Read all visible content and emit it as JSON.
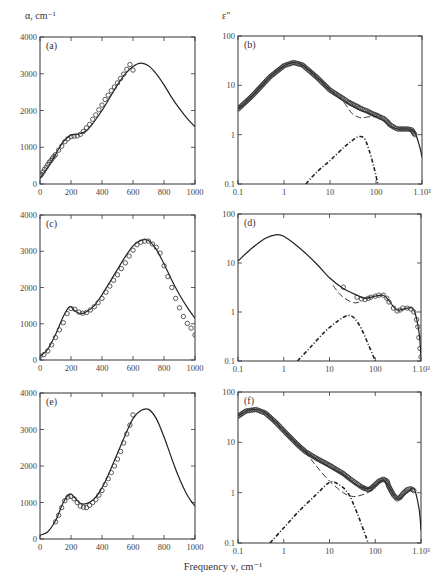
{
  "figure": {
    "left_ylabel": "α, cm⁻¹",
    "right_ylabel": "ε\"",
    "xlabel": "Frequency ν, cm⁻¹",
    "colors": {
      "line": "#222222",
      "frame": "#333333",
      "marker": "#333333",
      "background": "#ffffff"
    }
  },
  "chart_data": [
    {
      "panel": "(a)",
      "type": "line",
      "xscale": "linear",
      "yscale": "linear",
      "frame": [
        40,
        37,
        195,
        184
      ],
      "xlim": [
        0,
        1000
      ],
      "ylim": [
        0,
        4000
      ],
      "xticks": [
        0,
        200,
        400,
        600,
        800,
        1000
      ],
      "xticklabels": [
        "0",
        "200",
        "400",
        "600",
        "800",
        "1000"
      ],
      "yticks": [
        0,
        1000,
        2000,
        3000,
        4000
      ],
      "yticklabels": [
        "0",
        "1000",
        "2000",
        "3000",
        "4000"
      ],
      "ylabel": "α, cm⁻¹",
      "series": [
        {
          "name": "model",
          "style": "solid",
          "x": [
            0,
            50,
            100,
            150,
            200,
            250,
            300,
            350,
            400,
            450,
            500,
            550,
            600,
            650,
            700,
            750,
            800,
            850,
            900,
            950,
            1000
          ],
          "y": [
            150,
            450,
            800,
            1150,
            1330,
            1360,
            1450,
            1700,
            2000,
            2350,
            2700,
            3000,
            3200,
            3290,
            3220,
            3000,
            2700,
            2350,
            2050,
            1780,
            1560
          ]
        },
        {
          "name": "experiment",
          "style": "circles",
          "x": [
            0,
            10,
            20,
            30,
            40,
            50,
            60,
            70,
            80,
            90,
            100,
            120,
            140,
            160,
            180,
            200,
            220,
            240,
            260,
            280,
            300,
            320,
            340,
            360,
            380,
            400,
            420,
            440,
            460,
            480,
            500,
            520,
            540,
            560,
            580,
            600
          ],
          "y": [
            220,
            260,
            330,
            400,
            460,
            530,
            590,
            640,
            700,
            750,
            800,
            920,
            1030,
            1150,
            1230,
            1290,
            1300,
            1310,
            1350,
            1430,
            1530,
            1620,
            1760,
            1880,
            2020,
            2150,
            2300,
            2420,
            2540,
            2640,
            2750,
            2870,
            2990,
            3120,
            3250,
            3100
          ]
        }
      ]
    },
    {
      "panel": "(b)",
      "type": "line",
      "xscale": "log",
      "yscale": "log",
      "frame": [
        238,
        36,
        422,
        184
      ],
      "xlim": [
        0.1,
        1000
      ],
      "ylim": [
        0.1,
        100
      ],
      "xticks": [
        0.1,
        1,
        10,
        100,
        1000
      ],
      "xticklabels": [
        "0.1",
        "1",
        "10",
        "100",
        "1.10³"
      ],
      "yticks": [
        0.1,
        1,
        10,
        100
      ],
      "yticklabels": [
        "0.1",
        "1",
        "10",
        "100"
      ],
      "ylabel": "ε\"",
      "series": [
        {
          "name": "total",
          "style": "solid",
          "x": [
            0.1,
            0.2,
            0.5,
            1,
            1.6,
            2.5,
            5,
            10,
            20,
            40,
            70,
            100,
            150,
            200,
            300,
            500,
            700,
            900,
            1000
          ],
          "y": [
            3.3,
            6,
            15,
            25,
            29,
            26,
            15,
            8,
            4.8,
            3.3,
            2.7,
            2.3,
            1.9,
            1.5,
            1.3,
            1.3,
            1.1,
            0.55,
            0.35
          ]
        },
        {
          "name": "experiment",
          "style": "circles-dense",
          "x": [
            0.1,
            0.2,
            0.5,
            1,
            1.6,
            2.5,
            5,
            10,
            20,
            25,
            30,
            40,
            50,
            60,
            70,
            80,
            100,
            120,
            150,
            180,
            200,
            250,
            300,
            400,
            500,
            600,
            700
          ],
          "y": [
            3.3,
            6,
            15,
            25,
            29,
            26,
            15,
            8,
            5.3,
            4.6,
            4.2,
            3.7,
            3.3,
            3.1,
            2.9,
            2.7,
            2.5,
            2.3,
            2.1,
            1.8,
            1.6,
            1.4,
            1.3,
            1.3,
            1.3,
            1.25,
            1.0
          ]
        },
        {
          "name": "relaxation",
          "style": "dashed",
          "x": [
            20,
            25,
            30,
            40,
            50,
            70,
            100
          ],
          "y": [
            4.5,
            3.4,
            2.7,
            2.3,
            2.2,
            2.3,
            2.3
          ]
        },
        {
          "name": "resonance",
          "style": "dashdot",
          "x": [
            3,
            5,
            10,
            20,
            30,
            40,
            55,
            70,
            90,
            110
          ],
          "y": [
            0.1,
            0.17,
            0.3,
            0.55,
            0.75,
            0.9,
            0.85,
            0.5,
            0.22,
            0.1
          ]
        }
      ]
    },
    {
      "panel": "(c)",
      "type": "line",
      "xscale": "linear",
      "yscale": "linear",
      "frame": [
        40,
        215,
        195,
        360
      ],
      "xlim": [
        0,
        1000
      ],
      "ylim": [
        0,
        4000
      ],
      "xticks": [
        0,
        200,
        400,
        600,
        800,
        1000
      ],
      "xticklabels": [
        "0",
        "200",
        "400",
        "600",
        "800",
        "1000"
      ],
      "yticks": [
        0,
        1000,
        2000,
        3000,
        4000
      ],
      "yticklabels": [
        "0",
        "1000",
        "2000",
        "3000",
        "4000"
      ],
      "series": [
        {
          "name": "model",
          "style": "solid",
          "x": [
            0,
            50,
            100,
            150,
            190,
            220,
            260,
            300,
            350,
            400,
            450,
            500,
            550,
            600,
            650,
            700,
            750,
            800,
            850,
            900,
            950,
            1000
          ],
          "y": [
            100,
            300,
            700,
            1200,
            1470,
            1380,
            1280,
            1330,
            1500,
            1800,
            2150,
            2500,
            2850,
            3150,
            3300,
            3300,
            3050,
            2650,
            2200,
            1800,
            1450,
            1150
          ]
        },
        {
          "name": "experiment",
          "style": "circles",
          "x": [
            0,
            25,
            50,
            75,
            100,
            125,
            150,
            175,
            200,
            225,
            250,
            275,
            300,
            325,
            350,
            375,
            400,
            425,
            450,
            475,
            500,
            525,
            550,
            575,
            600,
            625,
            650,
            675,
            700,
            725,
            750,
            775,
            800,
            825,
            850,
            875,
            900,
            925,
            950,
            975,
            1000
          ],
          "y": [
            100,
            150,
            250,
            420,
            620,
            830,
            1030,
            1280,
            1420,
            1400,
            1320,
            1290,
            1310,
            1380,
            1470,
            1580,
            1700,
            1870,
            2040,
            2200,
            2350,
            2520,
            2680,
            2870,
            3030,
            3180,
            3250,
            3280,
            3280,
            3200,
            3110,
            2950,
            2600,
            2300,
            2000,
            1700,
            1440,
            1200,
            1010,
            880,
            690
          ]
        }
      ]
    },
    {
      "panel": "(d)",
      "type": "line",
      "xscale": "log",
      "yscale": "log",
      "frame": [
        238,
        214,
        421,
        361
      ],
      "xlim": [
        0.1,
        1000
      ],
      "ylim": [
        0.1,
        100
      ],
      "xticks": [
        0.1,
        1,
        10,
        100,
        1000
      ],
      "xticklabels": [
        "0.1",
        "1",
        "10",
        "100",
        "1.10³"
      ],
      "yticks": [
        0.1,
        1,
        10,
        100
      ],
      "yticklabels": [
        "0.1",
        "1",
        "10",
        "100"
      ],
      "series": [
        {
          "name": "total",
          "style": "solid",
          "x": [
            0.1,
            0.2,
            0.4,
            0.7,
            1,
            2,
            5,
            10,
            20,
            40,
            60,
            100,
            150,
            200,
            300,
            500,
            700,
            900,
            1000
          ],
          "y": [
            11,
            20,
            32,
            38,
            35,
            22,
            10,
            5,
            3,
            2.2,
            1.9,
            2.1,
            2.2,
            1.7,
            1.1,
            1.2,
            1.1,
            0.4,
            0.12
          ]
        },
        {
          "name": "experiment",
          "style": "circles",
          "x": [
            20,
            40,
            50,
            60,
            70,
            80,
            100,
            120,
            150,
            180,
            200,
            250,
            300,
            350,
            400,
            500,
            600,
            700,
            800,
            850,
            900,
            950,
            1000
          ],
          "y": [
            3.2,
            2.0,
            1.85,
            1.8,
            1.9,
            2.0,
            2.1,
            2.2,
            2.2,
            1.9,
            1.6,
            1.2,
            1.05,
            1.1,
            1.2,
            1.2,
            1.15,
            1.0,
            0.7,
            0.5,
            0.3,
            0.18,
            0.12
          ]
        },
        {
          "name": "relaxation",
          "style": "dashed",
          "x": [
            12,
            15,
            20,
            30,
            40,
            50
          ],
          "y": [
            3.5,
            2.6,
            2.0,
            1.6,
            1.55,
            1.7
          ]
        },
        {
          "name": "resonance",
          "style": "dashdot",
          "x": [
            2,
            4,
            8,
            15,
            25,
            35,
            50,
            70,
            100
          ],
          "y": [
            0.1,
            0.2,
            0.4,
            0.65,
            0.85,
            0.75,
            0.45,
            0.22,
            0.1
          ]
        }
      ]
    },
    {
      "panel": "(e)",
      "type": "line",
      "xscale": "linear",
      "yscale": "linear",
      "frame": [
        40,
        393,
        195,
        539
      ],
      "xlim": [
        0,
        1000
      ],
      "ylim": [
        0,
        4000
      ],
      "xticks": [
        0,
        200,
        400,
        600,
        800,
        1000
      ],
      "xticklabels": [
        "0",
        "200",
        "400",
        "600",
        "800",
        "1000"
      ],
      "yticks": [
        0,
        1000,
        2000,
        3000,
        4000
      ],
      "yticklabels": [
        "0",
        "1000",
        "2000",
        "3000",
        "4000"
      ],
      "series": [
        {
          "name": "model",
          "style": "solid",
          "x": [
            0,
            50,
            100,
            150,
            190,
            220,
            260,
            300,
            350,
            400,
            450,
            500,
            550,
            600,
            650,
            700,
            750,
            800,
            850,
            900,
            950,
            1000
          ],
          "y": [
            100,
            200,
            500,
            1000,
            1230,
            1150,
            980,
            970,
            1100,
            1400,
            1850,
            2350,
            2850,
            3300,
            3520,
            3550,
            3300,
            2800,
            2200,
            1650,
            1200,
            900
          ]
        },
        {
          "name": "experiment",
          "style": "circles",
          "x": [
            100,
            120,
            140,
            160,
            180,
            200,
            220,
            240,
            260,
            280,
            300,
            320,
            340,
            360,
            380,
            400,
            420,
            440,
            460,
            480,
            500,
            520,
            540,
            560,
            580,
            600
          ],
          "y": [
            470,
            650,
            860,
            1050,
            1150,
            1170,
            1100,
            1000,
            900,
            870,
            860,
            920,
            1000,
            1080,
            1200,
            1330,
            1490,
            1650,
            1820,
            2000,
            2190,
            2400,
            2630,
            2880,
            3120,
            3400
          ]
        }
      ]
    },
    {
      "panel": "(f)",
      "type": "line",
      "xscale": "log",
      "yscale": "log",
      "frame": [
        238,
        392,
        421,
        543
      ],
      "xlim": [
        0.1,
        1000
      ],
      "ylim": [
        0.1,
        100
      ],
      "xticks": [
        0.1,
        1,
        10,
        100,
        1000
      ],
      "xticklabels": [
        "0.1",
        "1",
        "10",
        "100",
        "1.10³"
      ],
      "yticks": [
        0.1,
        1,
        10,
        100
      ],
      "yticklabels": [
        "0.1",
        "1",
        "10",
        "100"
      ],
      "series": [
        {
          "name": "total",
          "style": "solid",
          "x": [
            0.1,
            0.15,
            0.25,
            0.4,
            0.7,
            1,
            2,
            3,
            5,
            10,
            20,
            40,
            70,
            100,
            150,
            200,
            300,
            500,
            700,
            900,
            1000
          ],
          "y": [
            33,
            42,
            45,
            38,
            24,
            17,
            9,
            6.5,
            4.7,
            3.2,
            2.3,
            1.4,
            1.2,
            1.4,
            1.8,
            1.3,
            0.75,
            1.0,
            1.2,
            0.5,
            0.18
          ]
        },
        {
          "name": "experiment",
          "style": "circles-dense",
          "x": [
            0.1,
            0.15,
            0.25,
            0.4,
            0.7,
            1,
            2,
            3,
            5,
            10,
            20,
            30,
            40,
            50,
            60,
            70,
            80,
            100,
            120,
            150,
            180,
            200,
            250,
            300,
            350,
            400,
            500,
            600,
            700
          ],
          "y": [
            33,
            42,
            45,
            38,
            24,
            17,
            9,
            6.5,
            4.9,
            3.5,
            2.4,
            1.8,
            1.5,
            1.3,
            1.2,
            1.15,
            1.2,
            1.45,
            1.7,
            1.85,
            1.7,
            1.3,
            0.9,
            0.75,
            0.8,
            0.95,
            1.15,
            1.2,
            1.1
          ]
        },
        {
          "name": "relaxation",
          "style": "dashed",
          "x": [
            3,
            5,
            10,
            20,
            30,
            40,
            60,
            100
          ],
          "y": [
            6.5,
            3.5,
            1.7,
            1.0,
            0.85,
            0.85,
            0.95,
            1.2
          ]
        },
        {
          "name": "resonance",
          "style": "dashdot",
          "x": [
            0.5,
            1,
            2,
            5,
            10,
            15,
            25,
            40,
            70
          ],
          "y": [
            0.1,
            0.2,
            0.4,
            0.9,
            1.6,
            1.5,
            1.0,
            0.4,
            0.1
          ]
        }
      ]
    }
  ]
}
